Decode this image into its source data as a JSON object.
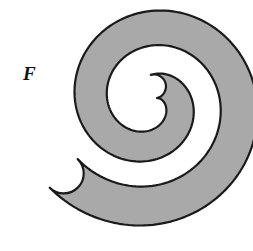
{
  "figure": {
    "kind": "geometric-region-diagram",
    "width": 253,
    "height": 251,
    "background_color": "#ffffff"
  },
  "labels": [
    {
      "name": "region-label-F",
      "text": "F",
      "x": 23,
      "y": 64,
      "font_size": 19,
      "style": "italic-serif-bold",
      "color": "#111111"
    }
  ],
  "shape": {
    "name": "spiral-band",
    "fill_color": "#a9a9a9",
    "stroke_color": "#1a1a1a",
    "stroke_width": 2.2,
    "turns": 1.6,
    "outer_bounds": {
      "left": 46,
      "top": 11,
      "right": 236,
      "bottom": 238
    },
    "center": {
      "x": 150,
      "y": 102
    },
    "inner_tip": {
      "x": 166,
      "y": 69
    },
    "outer_tip": {
      "x": 205,
      "y": 228
    },
    "band_thickness_outer": 40,
    "band_thickness_inner": 24,
    "path": "M 166.0 69.0 C 152.0 63.5 136.5 72.0 132.5 86.5 C 127.5 104.0 139.5 120.5 157.5 122.0 C 181.0 124.0 200.5 105.0 200.0 81.5 C 199.3 51.5 173.0 29.0 143.0 30.5 C 104.5 32.4 74.5 66.0 76.6 104.5 C 79.2 152.5 120.0 189.5 168.0 187.0 C 184.0 186.2 197.0 192.0 202.5 201.0 C 210.5 214.0 206.0 230.0 191.5 235.5 C 176.5 241.2 160.0 238.5 145.0 235.0 C 83.0 220.5 40.5 161.5 46.5 97.5 C 53.0 28.0 117.0 -14.5 185.0 4.5 C 239.0 19.6 259.0 83.0 236.5 127.0 C 217.0 165.0 170.0 178.0 139.0 154.0 C 113.5 134.2 107.5 96.0 127.0 71.5 C 136.5 59.5 152.0 56.0 164.5 61.5 C 168.5 63.2 170.0 67.0 166.0 69.0 Z"
  }
}
